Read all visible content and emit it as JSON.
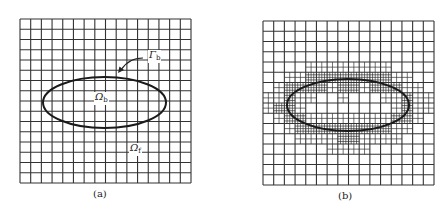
{
  "panels": [
    {
      "id": "a",
      "caption": "(a)",
      "description": "uniform Cartesian background grid with embedded elliptical body",
      "grid_cells": 16,
      "refinement": "none",
      "labels": {
        "boundary": {
          "symbol": "Γ",
          "subscript": "b"
        },
        "body": {
          "symbol": "Ω",
          "subscript": "b"
        },
        "fluid": {
          "symbol": "Ω",
          "subscript": "f"
        }
      }
    },
    {
      "id": "b",
      "caption": "(b)",
      "description": "grid locally refined near the elliptical boundary",
      "grid_cells": 16,
      "refinement": "adaptive near boundary"
    }
  ],
  "colors": {
    "grid": "#333333",
    "ellipse": "#1a1a1a",
    "background": "#ffffff"
  }
}
